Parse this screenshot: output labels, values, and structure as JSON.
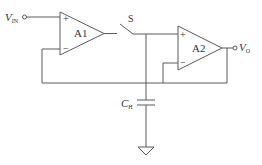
{
  "diagram": {
    "type": "sample-and-hold circuit",
    "input_label": {
      "main": "V",
      "sub": "IN"
    },
    "output_label": {
      "main": "V",
      "sub": "O"
    },
    "amplifiers": [
      {
        "id": "A1",
        "label": "A1",
        "plus": "+",
        "minus": "−"
      },
      {
        "id": "A2",
        "label": "A2",
        "plus": "+",
        "minus": "−"
      }
    ],
    "switch": {
      "label": "S"
    },
    "capacitor": {
      "main": "C",
      "sub": "H"
    },
    "ground": "ground-symbol",
    "line_color": "#5a5a5a"
  }
}
